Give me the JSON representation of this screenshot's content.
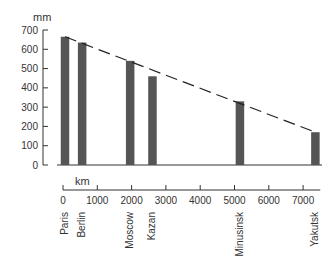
{
  "chart_data": {
    "type": "bar",
    "title": "",
    "ylabel": "mm",
    "xlabel": "km",
    "ylim": [
      0,
      700
    ],
    "yticks": [
      0,
      100,
      200,
      300,
      400,
      500,
      600,
      700
    ],
    "xlim": [
      0,
      7500
    ],
    "xticks": [
      0,
      1000,
      2000,
      3000,
      4000,
      5000,
      6000,
      7000
    ],
    "grid": false,
    "legend": null,
    "categories": [
      "Paris",
      "Berlin",
      "Moscow",
      "Kazan",
      "Minusinsk",
      "Yakutsk"
    ],
    "distance_km": [
      0,
      500,
      1900,
      2550,
      5100,
      7300
    ],
    "values": [
      665,
      635,
      540,
      460,
      330,
      170
    ],
    "trend_line": {
      "style": "dashed",
      "from": {
        "x_km": 0,
        "y_mm": 665
      },
      "to": {
        "x_km": 7300,
        "y_mm": 170
      }
    },
    "colors": {
      "bar": "#555555",
      "axis": "#333333",
      "trend": "#222222"
    }
  }
}
